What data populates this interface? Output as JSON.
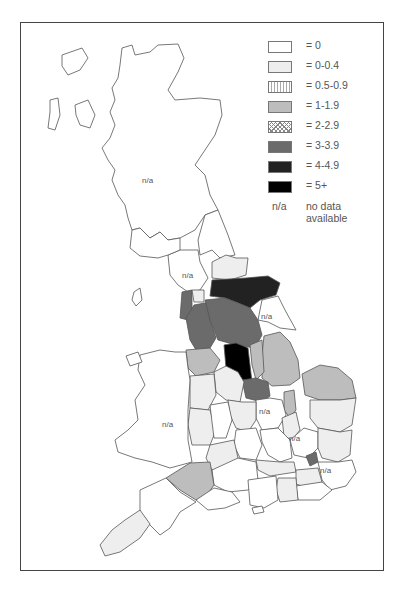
{
  "legend": {
    "items": [
      {
        "label": "= 0",
        "fill": "#ffffff",
        "pattern": "none"
      },
      {
        "label": "= 0-0.4",
        "fill": "#eeeeee",
        "pattern": "none"
      },
      {
        "label": "= 0.5-0.9",
        "fill": "#ffffff",
        "pattern": "vertical-lines"
      },
      {
        "label": "= 1-1.9",
        "fill": "#bdbdbd",
        "pattern": "none"
      },
      {
        "label": "= 2-2.9",
        "fill": "#ffffff",
        "pattern": "crosshatch"
      },
      {
        "label": "= 3-3.9",
        "fill": "#6b6b6b",
        "pattern": "none"
      },
      {
        "label": "= 4-4.9",
        "fill": "#222222",
        "pattern": "none"
      },
      {
        "label": "= 5+",
        "fill": "#000000",
        "pattern": "none"
      }
    ],
    "na_key": "n/a",
    "na_desc_line1": "no data",
    "na_desc_line2": "available"
  },
  "map": {
    "labels": [
      {
        "text": "n/a",
        "region": "scotland"
      },
      {
        "text": "n/a",
        "region": "cumbria"
      },
      {
        "text": "n/a",
        "region": "humberside"
      },
      {
        "text": "n/a",
        "region": "wales"
      },
      {
        "text": "n/a",
        "region": "northamptonshire"
      },
      {
        "text": "n/a",
        "region": "hertfordshire"
      },
      {
        "text": "n/a",
        "region": "kent"
      }
    ]
  }
}
